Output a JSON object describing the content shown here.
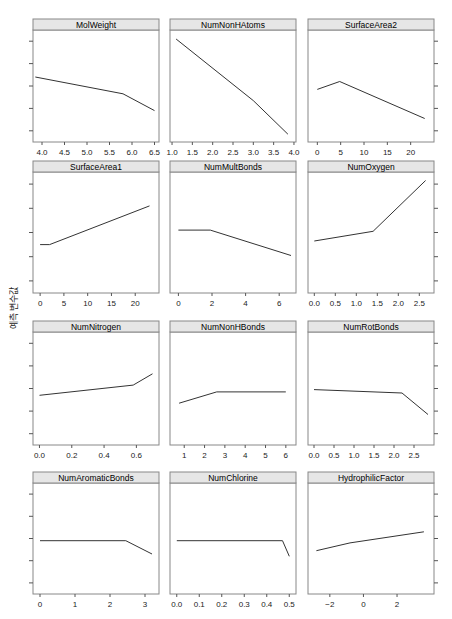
{
  "chart_data": {
    "type": "line",
    "title": "",
    "ylabel": "예측 변수값",
    "xlabel": "",
    "grid": false,
    "layout": {
      "columns": 3,
      "rows": 4
    },
    "y_axis": {
      "ticks": 5,
      "tick_labels_shown": false,
      "shared": true
    },
    "panels": [
      {
        "name": "MolWeight",
        "xlim": [
          3.8,
          6.6
        ],
        "xticks": [
          4.0,
          4.5,
          5.0,
          5.5,
          6.0,
          6.5
        ],
        "xtick_labels": [
          "4.0",
          "4.5",
          "5.0",
          "5.5",
          "6.0",
          "6.5"
        ],
        "x": [
          3.85,
          5.8,
          6.5
        ],
        "y": [
          0.58,
          0.43,
          0.28
        ]
      },
      {
        "name": "NumNonHAtoms",
        "xlim": [
          0.95,
          4.05
        ],
        "xticks": [
          1.0,
          1.5,
          2.0,
          2.5,
          3.0,
          3.5,
          4.0
        ],
        "xtick_labels": [
          "1.0",
          "1.5",
          "2.0",
          "2.5",
          "3.0",
          "3.5",
          "4.0"
        ],
        "x": [
          1.1,
          3.0,
          3.85
        ],
        "y": [
          0.92,
          0.37,
          0.07
        ]
      },
      {
        "name": "SurfaceArea2",
        "xlim": [
          -2,
          25
        ],
        "xticks": [
          0,
          5,
          10,
          15,
          20
        ],
        "xtick_labels": [
          "0",
          "5",
          "10",
          "15",
          "20"
        ],
        "x": [
          0,
          4.8,
          23
        ],
        "y": [
          0.47,
          0.54,
          0.21
        ]
      },
      {
        "name": "SurfaceArea1",
        "xlim": [
          -1.5,
          25
        ],
        "xticks": [
          0,
          5,
          10,
          15,
          20
        ],
        "xtick_labels": [
          "0",
          "5",
          "10",
          "15",
          "20"
        ],
        "x": [
          0,
          2,
          23
        ],
        "y": [
          0.4,
          0.4,
          0.72
        ]
      },
      {
        "name": "NumMultBonds",
        "xlim": [
          -0.5,
          7.0
        ],
        "xticks": [
          0,
          2,
          4,
          6
        ],
        "xtick_labels": [
          "0",
          "2",
          "4",
          "6"
        ],
        "x": [
          0,
          1.9,
          6.7
        ],
        "y": [
          0.52,
          0.52,
          0.31
        ]
      },
      {
        "name": "NumOxygen",
        "xlim": [
          -0.15,
          2.85
        ],
        "xticks": [
          0.0,
          0.5,
          1.0,
          1.5,
          2.0,
          2.5
        ],
        "xtick_labels": [
          "0.0",
          "0.5",
          "1.0",
          "1.5",
          "2.0",
          "2.5"
        ],
        "x": [
          0.0,
          1.4,
          2.65
        ],
        "y": [
          0.43,
          0.51,
          0.93
        ]
      },
      {
        "name": "NumNitrogen",
        "xlim": [
          -0.04,
          0.74
        ],
        "xticks": [
          0.0,
          0.2,
          0.4,
          0.6
        ],
        "xtick_labels": [
          "0.0",
          "0.2",
          "0.4",
          "0.6"
        ],
        "x": [
          0.0,
          0.58,
          0.7
        ],
        "y": [
          0.44,
          0.53,
          0.63
        ]
      },
      {
        "name": "NumNonHBonds",
        "xlim": [
          0.3,
          6.5
        ],
        "xticks": [
          1,
          2,
          3,
          4,
          5,
          6
        ],
        "xtick_labels": [
          "1",
          "2",
          "3",
          "4",
          "5",
          "6"
        ],
        "x": [
          0.75,
          2.6,
          6.0
        ],
        "y": [
          0.37,
          0.47,
          0.47
        ]
      },
      {
        "name": "NumRotBonds",
        "xlim": [
          -0.15,
          3.0
        ],
        "xticks": [
          0.0,
          0.5,
          1.0,
          1.5,
          2.0,
          2.5
        ],
        "xtick_labels": [
          "0.0",
          "0.5",
          "1.0",
          "1.5",
          "2.0",
          "2.5"
        ],
        "x": [
          0.0,
          2.2,
          2.85
        ],
        "y": [
          0.49,
          0.46,
          0.27
        ]
      },
      {
        "name": "NumAromaticBonds",
        "xlim": [
          -0.2,
          3.4
        ],
        "xticks": [
          0,
          1,
          2,
          3
        ],
        "xtick_labels": [
          "0",
          "1",
          "2",
          "3"
        ],
        "x": [
          0,
          2.45,
          3.2
        ],
        "y": [
          0.48,
          0.48,
          0.36
        ]
      },
      {
        "name": "NumChlorine",
        "xlim": [
          -0.03,
          0.53
        ],
        "xticks": [
          0.0,
          0.1,
          0.2,
          0.3,
          0.4,
          0.5
        ],
        "xtick_labels": [
          "0.0",
          "0.1",
          "0.2",
          "0.3",
          "0.4",
          "0.5"
        ],
        "x": [
          0.0,
          0.47,
          0.5
        ],
        "y": [
          0.48,
          0.48,
          0.34
        ]
      },
      {
        "name": "HydrophilicFactor",
        "xlim": [
          -3.3,
          4.2
        ],
        "xticks": [
          -2,
          0,
          2
        ],
        "xtick_labels": [
          "−2",
          "0",
          "2"
        ],
        "x": [
          -2.8,
          -0.8,
          3.6
        ],
        "y": [
          0.39,
          0.46,
          0.56
        ]
      }
    ]
  },
  "style": {
    "strip_fill": "#e6e6e6",
    "strip_border": "#888888",
    "panel_border": "#888888",
    "line_color": "#333333",
    "tick_color": "#555555"
  }
}
